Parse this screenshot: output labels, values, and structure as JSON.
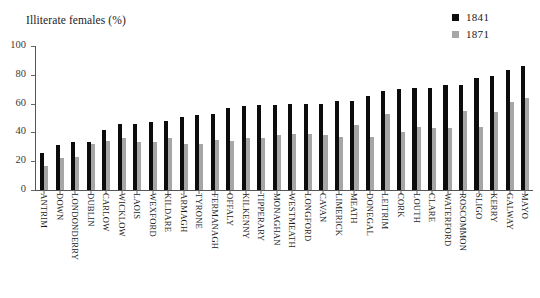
{
  "caption_remnant": " ",
  "axis_title": "Illiterate females (%)",
  "legend": {
    "position": "top-right",
    "entries": [
      {
        "label": "1841",
        "color": "#0c0c0c"
      },
      {
        "label": "1871",
        "color": "#a6a6a6"
      }
    ]
  },
  "yaxis": {
    "ticks": [
      "0",
      "20",
      "40",
      "60",
      "80",
      "100"
    ]
  },
  "chart_data": {
    "type": "bar",
    "title": "Illiterate females (%)",
    "xlabel": "",
    "ylabel": "Illiterate females (%)",
    "ylim": [
      0,
      100
    ],
    "grid": false,
    "legend_position": "top-right",
    "categories": [
      "ANTRIM",
      "DOWN",
      "LONDONDERRY",
      "DUBLIN",
      "CARLOW",
      "WICKLOW",
      "LAOIS",
      "WEXFORD",
      "KILDARE",
      "ARMAGH",
      "TYRONE",
      "FERMANAGH",
      "OFFALY",
      "KILKENNY",
      "TIPPERARY",
      "MONAGHAN",
      "WESTMEATH",
      "LONGFORD",
      "CAVAN",
      "LIMERICK",
      "MEATH",
      "DONEGAL",
      "LEITRIM",
      "CORK",
      "LOUTH",
      "CLARE",
      "WATERFORD",
      "ROSCOMMON",
      "SLIGO",
      "KERRY",
      "GALWAY",
      "MAYO"
    ],
    "series": [
      {
        "name": "1841",
        "color": "#0c0c0c",
        "values": [
          26,
          31,
          33,
          33,
          42,
          46,
          46,
          47,
          48,
          51,
          52,
          53,
          57,
          58,
          59,
          59,
          60,
          60,
          60,
          62,
          62,
          65,
          69,
          70,
          71,
          71,
          73,
          73,
          78,
          79,
          83,
          86
        ]
      },
      {
        "name": "1871",
        "color": "#a6a6a6",
        "values": [
          17,
          22,
          23,
          32,
          34,
          36,
          33,
          33,
          36,
          32,
          32,
          35,
          34,
          36,
          36,
          38,
          39,
          39,
          38,
          37,
          45,
          37,
          53,
          40,
          44,
          43,
          43,
          55,
          44,
          54,
          61,
          64
        ]
      }
    ]
  }
}
